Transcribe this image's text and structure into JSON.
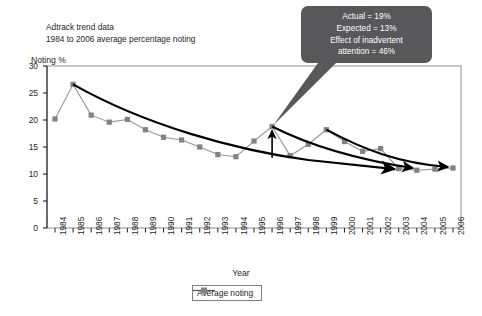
{
  "title": {
    "line1": "Adtrack trend data",
    "line2": "1984 to 2006 average percentage noting"
  },
  "callout": {
    "line1": "Actual = 19%",
    "line2": "Expected = 13%",
    "line3": "Effect of inadvertent",
    "line4": "attention = 46%",
    "background": "#58585a",
    "text_color": "#ffffff"
  },
  "legend": {
    "position": "bottom-center",
    "entries": [
      {
        "label": "Average noting",
        "color": "#808285",
        "marker": "square"
      }
    ]
  },
  "colors": {
    "series_line": "#939598",
    "series_marker": "#808285",
    "trend_curve": "#000000",
    "axis": "#231f20",
    "plot_border": "#808080"
  },
  "chart_data": {
    "type": "line",
    "xlabel": "Year",
    "ylabel": "Noting %",
    "ylim": [
      0,
      30
    ],
    "yticks": [
      0,
      5,
      10,
      15,
      20,
      25,
      30
    ],
    "grid": false,
    "legend_position": "bottom-center",
    "categories": [
      "1984",
      "1985",
      "1986",
      "1987",
      "1988",
      "1989",
      "1990",
      "1991",
      "1992",
      "1993",
      "1994",
      "1995",
      "1996",
      "1997",
      "1998",
      "1999",
      "2000",
      "2001",
      "2002",
      "2003",
      "2004",
      "2005",
      "2006"
    ],
    "series": [
      {
        "name": "Average noting",
        "values": [
          20.2,
          26.6,
          20.9,
          19.6,
          20.1,
          18.2,
          16.8,
          16.3,
          15.0,
          13.6,
          13.2,
          16.1,
          18.8,
          13.4,
          15.5,
          18.2,
          16.0,
          14.2,
          14.7,
          11.0,
          10.7,
          10.9,
          11.1
        ]
      }
    ],
    "annotations": [
      {
        "name": "callout-box",
        "text": "Actual = 19% / Expected = 13% / Effect of inadvertent attention = 46%",
        "points_to_year": "1996",
        "points_to_value": 18.8
      },
      {
        "name": "vertical-arrow-1996",
        "from_value": 13.0,
        "to_value": 18.8,
        "year": "1996"
      },
      {
        "name": "trend-curve-main",
        "description": "Smooth decay curve 1985 (26.6) to 2003 (11.0), arrowhead"
      },
      {
        "name": "trend-curve-from-1996",
        "description": "Decay curve from 1996 peak (18.8) to 2004 (11.0), arrowhead"
      },
      {
        "name": "trend-curve-from-1999",
        "description": "Decay curve from 1999 peak (18.2) to 2006 (11.1), arrowhead"
      }
    ]
  }
}
